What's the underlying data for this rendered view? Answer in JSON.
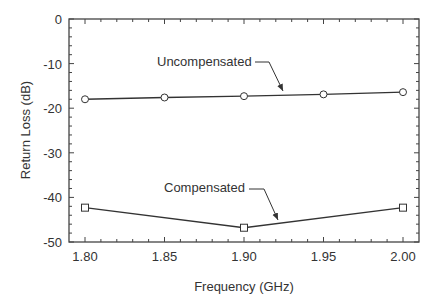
{
  "chart_data": {
    "type": "line",
    "title": "",
    "xlabel": "Frequency  (GHz)",
    "ylabel": "Return Loss  (dB)",
    "xlim": [
      1.8,
      2.0
    ],
    "ylim": [
      -50,
      0
    ],
    "x_ticks": [
      "1.80",
      "1.85",
      "1.90",
      "1.95",
      "2.00"
    ],
    "y_ticks": [
      "0",
      "-10",
      "-20",
      "-30",
      "-40",
      "-50"
    ],
    "grid": false,
    "legend": "annotations with arrows",
    "series": [
      {
        "name": "Uncompensated",
        "marker": "circle",
        "x": [
          1.8,
          1.85,
          1.9,
          1.95,
          2.0
        ],
        "values": [
          -18.0,
          -17.6,
          -17.3,
          -16.9,
          -16.4
        ]
      },
      {
        "name": "Compensated",
        "marker": "square",
        "x": [
          1.8,
          1.9,
          2.0
        ],
        "values": [
          -42.3,
          -46.8,
          -42.3
        ]
      }
    ],
    "annotations": [
      {
        "text": "Uncompensated",
        "target_series": "Uncompensated"
      },
      {
        "text": "Compensated",
        "target_series": "Compensated"
      }
    ]
  },
  "colors": {
    "line": "#333333",
    "axis": "#444444",
    "text": "#333333",
    "background": "#ffffff"
  }
}
